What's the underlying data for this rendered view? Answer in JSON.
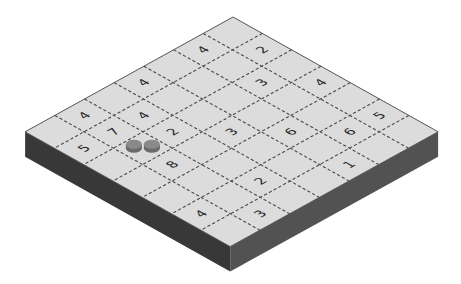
{
  "board": {
    "rows": 7,
    "cols": 7,
    "colors": {
      "top_face": "#dcdcdc",
      "left_side": "#383838",
      "right_side": "#525252",
      "edge": "#555555",
      "grid": "#4a4a4a",
      "number": "#2a2a2a",
      "disc_top": "#8a8a8a",
      "disc_side": "#6a6a6a"
    },
    "clues": [
      {
        "row": 0,
        "col": 1,
        "value": "2"
      },
      {
        "row": 0,
        "col": 3,
        "value": "4"
      },
      {
        "row": 0,
        "col": 5,
        "value": "5"
      },
      {
        "row": 1,
        "col": 0,
        "value": "4"
      },
      {
        "row": 1,
        "col": 2,
        "value": "3"
      },
      {
        "row": 1,
        "col": 5,
        "value": "6"
      },
      {
        "row": 2,
        "col": 4,
        "value": "6"
      },
      {
        "row": 2,
        "col": 6,
        "value": "1"
      },
      {
        "row": 3,
        "col": 0,
        "value": "4"
      },
      {
        "row": 3,
        "col": 3,
        "value": "3"
      },
      {
        "row": 4,
        "col": 1,
        "value": "4"
      },
      {
        "row": 4,
        "col": 2,
        "value": "2"
      },
      {
        "row": 4,
        "col": 5,
        "value": "2"
      },
      {
        "row": 5,
        "col": 0,
        "value": "4"
      },
      {
        "row": 5,
        "col": 1,
        "value": "7"
      },
      {
        "row": 5,
        "col": 3,
        "value": "8"
      },
      {
        "row": 5,
        "col": 6,
        "value": "3"
      },
      {
        "row": 6,
        "col": 1,
        "value": "5"
      },
      {
        "row": 6,
        "col": 5,
        "value": "4"
      }
    ],
    "discs": [
      {
        "row": 5,
        "col": 2,
        "offset": -0.3
      },
      {
        "row": 5,
        "col": 2,
        "offset": 0.3
      }
    ]
  }
}
